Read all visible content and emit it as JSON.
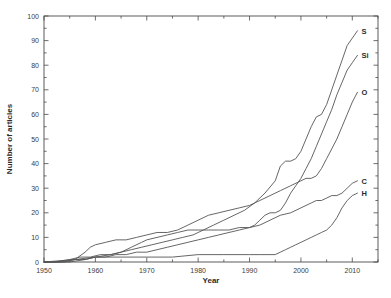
{
  "chart_data": {
    "type": "line",
    "title": "",
    "xlabel": "Year",
    "ylabel": "Number of articles",
    "xlim": [
      1950,
      2015
    ],
    "ylim": [
      0,
      100
    ],
    "grid": false,
    "legend_position": "right-end-of-line labels",
    "xticks": [
      1950,
      1960,
      1970,
      1980,
      1990,
      2000,
      2010
    ],
    "xtick_labels": [
      "1950",
      "1960",
      "1970",
      "1980",
      "1990",
      "2000",
      "2010"
    ],
    "yticks": [
      0,
      10,
      20,
      30,
      40,
      50,
      60,
      70,
      80,
      90,
      100
    ],
    "ytick_labels": [
      "0",
      "10",
      "20",
      "30",
      "40",
      "50",
      "60",
      "70",
      "80",
      "90",
      "100"
    ],
    "x_minor_tick_step": 5,
    "y_minor_tick_step": 5,
    "series": [
      {
        "name": "S",
        "label": "S",
        "label_value": 94,
        "x": [
          1950,
          1952,
          1955,
          1957,
          1959,
          1961,
          1963,
          1965,
          1967,
          1969,
          1971,
          1973,
          1975,
          1977,
          1979,
          1981,
          1983,
          1985,
          1987,
          1989,
          1991,
          1993,
          1995,
          1996,
          1997,
          1998,
          1999,
          2000,
          2001,
          2002,
          2003,
          2004,
          2005,
          2006,
          2007,
          2008,
          2009,
          2010,
          2011
        ],
        "y": [
          0,
          0,
          1,
          2,
          2,
          3,
          3,
          4,
          5,
          6,
          7,
          8,
          9,
          10,
          11,
          13,
          15,
          17,
          19,
          21,
          24,
          28,
          33,
          39,
          41,
          41,
          42,
          45,
          50,
          55,
          59,
          60,
          64,
          70,
          76,
          82,
          88,
          91,
          94
        ]
      },
      {
        "name": "Si",
        "label": "Si",
        "label_value": 84,
        "x": [
          1950,
          1953,
          1956,
          1958,
          1960,
          1962,
          1964,
          1966,
          1968,
          1970,
          1972,
          1974,
          1976,
          1978,
          1980,
          1982,
          1984,
          1986,
          1988,
          1990,
          1991,
          1992,
          1993,
          1994,
          1995,
          1996,
          1997,
          1998,
          1999,
          2000,
          2001,
          2002,
          2003,
          2004,
          2005,
          2006,
          2007,
          2008,
          2009,
          2010,
          2011
        ],
        "y": [
          0,
          0,
          1,
          1,
          2,
          2,
          3,
          3,
          4,
          4,
          5,
          6,
          7,
          8,
          9,
          10,
          11,
          12,
          13,
          14,
          15,
          17,
          19,
          20,
          20,
          21,
          24,
          28,
          31,
          34,
          38,
          42,
          47,
          52,
          57,
          62,
          68,
          73,
          78,
          81,
          84
        ]
      },
      {
        "name": "O",
        "label": "O",
        "label_value": 69,
        "x": [
          1950,
          1954,
          1956,
          1958,
          1959,
          1960,
          1962,
          1964,
          1966,
          1968,
          1970,
          1972,
          1974,
          1976,
          1978,
          1980,
          1982,
          1984,
          1986,
          1988,
          1990,
          1992,
          1994,
          1996,
          1998,
          2000,
          2001,
          2002,
          2003,
          2004,
          2005,
          2006,
          2007,
          2008,
          2009,
          2010,
          2011
        ],
        "y": [
          0,
          0,
          1,
          4,
          6,
          7,
          8,
          9,
          9,
          10,
          11,
          12,
          12,
          13,
          15,
          17,
          19,
          20,
          21,
          22,
          23,
          25,
          27,
          29,
          31,
          33,
          34,
          34,
          35,
          38,
          42,
          46,
          50,
          55,
          60,
          65,
          69
        ]
      },
      {
        "name": "C",
        "label": "C",
        "label_value": 33,
        "x": [
          1950,
          1955,
          1958,
          1960,
          1963,
          1965,
          1967,
          1969,
          1970,
          1972,
          1974,
          1976,
          1978,
          1980,
          1982,
          1984,
          1986,
          1988,
          1990,
          1992,
          1994,
          1996,
          1998,
          2000,
          2002,
          2003,
          2004,
          2005,
          2006,
          2007,
          2008,
          2009,
          2010,
          2011
        ],
        "y": [
          0,
          0,
          1,
          2,
          3,
          4,
          6,
          8,
          9,
          10,
          11,
          12,
          13,
          13,
          13,
          13,
          13,
          14,
          14,
          15,
          17,
          19,
          20,
          22,
          24,
          25,
          25,
          26,
          27,
          27,
          28,
          30,
          32,
          33
        ]
      },
      {
        "name": "H",
        "label": "H",
        "label_value": 28,
        "x": [
          1950,
          1956,
          1960,
          1965,
          1970,
          1975,
          1980,
          1985,
          1990,
          1992,
          1994,
          1995,
          1996,
          1997,
          1998,
          1999,
          2000,
          2001,
          2002,
          2003,
          2004,
          2005,
          2006,
          2007,
          2008,
          2009,
          2010,
          2011
        ],
        "y": [
          0,
          1,
          2,
          2,
          2,
          2,
          3,
          3,
          3,
          3,
          3,
          3,
          4,
          5,
          6,
          7,
          8,
          9,
          10,
          11,
          12,
          13,
          15,
          18,
          22,
          25,
          27,
          28
        ]
      }
    ]
  },
  "axis": {
    "xlabel": "Year",
    "ylabel": "Number of articles"
  }
}
